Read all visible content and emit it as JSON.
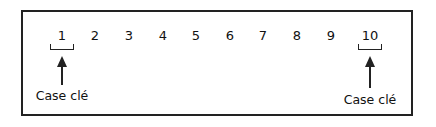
{
  "diagram": {
    "cells": [
      "1",
      "2",
      "3",
      "4",
      "5",
      "6",
      "7",
      "8",
      "9",
      "10"
    ],
    "key_cells": [
      {
        "cell": "1",
        "label": "Case clé"
      },
      {
        "cell": "10",
        "label": "Case clé"
      }
    ]
  }
}
